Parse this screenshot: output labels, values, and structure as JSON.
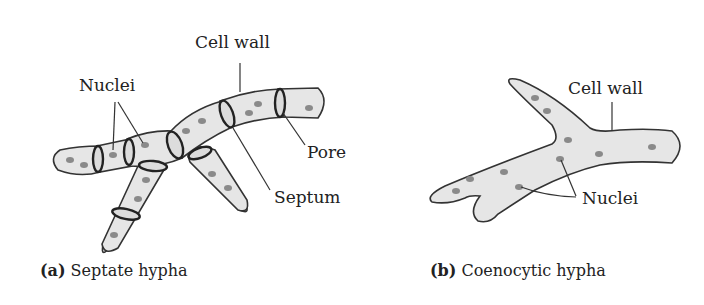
{
  "figure": {
    "panel_a": {
      "caption_letter": "(a)",
      "caption_text": " Septate hypha",
      "labels": {
        "cell_wall": "Cell wall",
        "nuclei": "Nuclei",
        "pore": "Pore",
        "septum": "Septum"
      }
    },
    "panel_b": {
      "caption_letter": "(b)",
      "caption_text": " Coenocytic hypha",
      "labels": {
        "cell_wall": "Cell wall",
        "nuclei": "Nuclei"
      }
    },
    "colors": {
      "cytoplasm": "#e6e6e6",
      "outline": "#333333",
      "nucleus": "#8a8a8a"
    }
  }
}
